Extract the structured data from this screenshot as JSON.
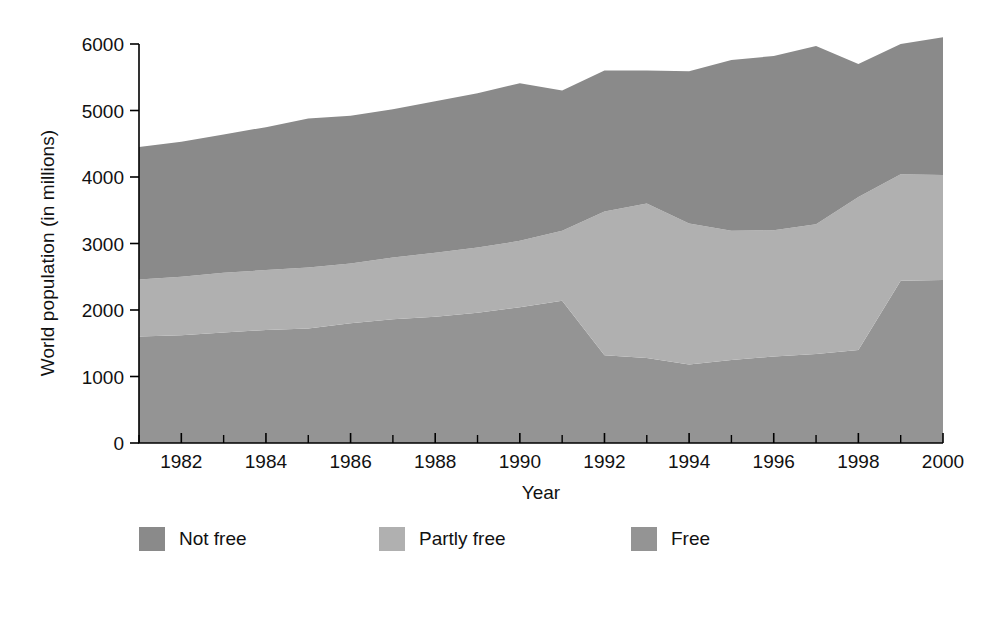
{
  "chart_data": {
    "type": "area",
    "stacked": true,
    "title": "",
    "xlabel": "Year",
    "ylabel": "World population (in millions)",
    "xlim": [
      1981,
      2000
    ],
    "ylim": [
      0,
      6000
    ],
    "grid": false,
    "legend_position": "bottom-left",
    "x_tick_labels": [
      "1982",
      "1984",
      "1986",
      "1988",
      "1990",
      "1992",
      "1994",
      "1996",
      "1998",
      "2000"
    ],
    "x_tick_values": [
      1982,
      1984,
      1986,
      1988,
      1990,
      1992,
      1994,
      1996,
      1998,
      2000
    ],
    "x_minor_tick_values": [
      1981,
      1983,
      1985,
      1987,
      1989,
      1991,
      1993,
      1995,
      1997,
      1999
    ],
    "y_tick_labels": [
      "0",
      "1000",
      "2000",
      "3000",
      "4000",
      "5000",
      "6000"
    ],
    "y_tick_values": [
      0,
      1000,
      2000,
      3000,
      4000,
      5000,
      6000
    ],
    "x": [
      1981,
      1982,
      1983,
      1984,
      1985,
      1986,
      1987,
      1988,
      1989,
      1990,
      1991,
      1992,
      1993,
      1994,
      1995,
      1996,
      1997,
      1998,
      1999,
      2000
    ],
    "series": [
      {
        "name": "Free",
        "color": "#949494",
        "stack_order": 1,
        "values": [
          1600,
          1620,
          1660,
          1700,
          1720,
          1800,
          1860,
          1900,
          1960,
          2040,
          2140,
          1320,
          1280,
          1180,
          1250,
          1300,
          1340,
          1400,
          2440,
          2450
        ]
      },
      {
        "name": "Partly free",
        "color": "#b0b0b0",
        "stack_order": 2,
        "values": [
          860,
          880,
          900,
          900,
          920,
          900,
          930,
          960,
          980,
          1000,
          1050,
          2160,
          2320,
          2120,
          1940,
          1900,
          1950,
          2300,
          1600,
          1580
        ]
      },
      {
        "name": "Not free",
        "color": "#8a8a8a",
        "stack_order": 3,
        "values": [
          1990,
          2030,
          2080,
          2150,
          2240,
          2220,
          2230,
          2280,
          2320,
          2370,
          2110,
          2120,
          2000,
          2290,
          2570,
          2620,
          2680,
          2000,
          1960,
          2070
        ]
      }
    ],
    "stack_totals": [
      4450,
      4530,
      4640,
      4750,
      4880,
      4920,
      5020,
      5140,
      5260,
      5410,
      5300,
      5600,
      5600,
      5590,
      5760,
      5820,
      5970,
      5700,
      6000,
      6100
    ]
  },
  "legend": {
    "items": [
      {
        "label": "Not free",
        "color": "#8a8a8a"
      },
      {
        "label": "Partly free",
        "color": "#b0b0b0"
      },
      {
        "label": "Free",
        "color": "#949494"
      }
    ]
  },
  "axes": {
    "x_title": "Year",
    "y_title": "World population (in millions)"
  }
}
